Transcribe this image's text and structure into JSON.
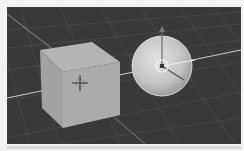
{
  "app": {
    "type": "3d-viewport",
    "mode": "object-mode"
  },
  "viewport": {
    "background_color": "#3a3a3a",
    "grid_color": "#4a4a4a",
    "axis_line_color": "#bdbdbd",
    "objects": [
      {
        "name": "cube",
        "type": "mesh-cube",
        "selected": false,
        "color": "#a8a8a8"
      },
      {
        "name": "sphere",
        "type": "mesh-uv-sphere",
        "selected": true,
        "color": "#c8c8c8"
      }
    ],
    "cursor_3d": {
      "visible": true,
      "position_px": [
        72,
        83
      ]
    },
    "transform_gizmo": {
      "visible": true,
      "target": "sphere",
      "center_px": [
        162,
        64
      ]
    }
  }
}
